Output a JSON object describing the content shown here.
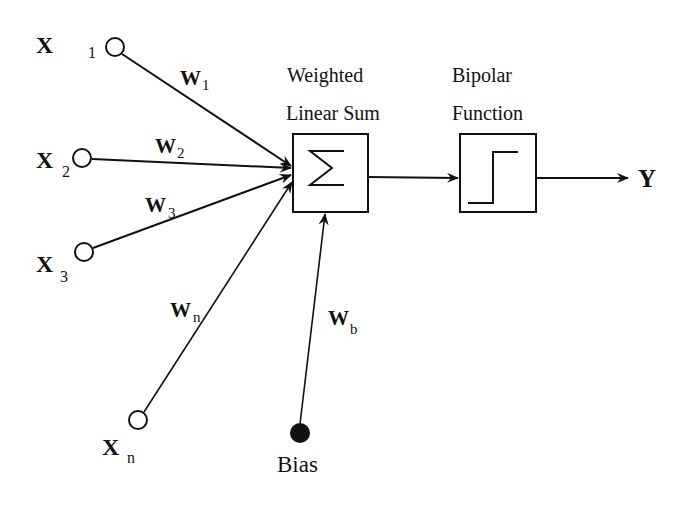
{
  "diagram": {
    "inputs": [
      {
        "id": "x1",
        "var": "X",
        "sub": "1",
        "weight_var": "W",
        "weight_sub": "1"
      },
      {
        "id": "x2",
        "var": "X",
        "sub": "2",
        "weight_var": "W",
        "weight_sub": "2"
      },
      {
        "id": "x3",
        "var": "X",
        "sub": "3",
        "weight_var": "W",
        "weight_sub": "3"
      },
      {
        "id": "xn",
        "var": "X",
        "sub": "n",
        "weight_var": "W",
        "weight_sub": "n"
      }
    ],
    "bias": {
      "label": "Bias",
      "weight_var": "W",
      "weight_sub": "b"
    },
    "sum_block": {
      "label_line1": "Weighted",
      "label_line2": "Linear Sum",
      "symbol": "Σ"
    },
    "activation_block": {
      "label_line1": "Bipolar",
      "label_line2": "Function",
      "shape": "step-function"
    },
    "output": {
      "label": "Y"
    },
    "colors": {
      "stroke": "#111111",
      "background": "#ffffff"
    }
  }
}
